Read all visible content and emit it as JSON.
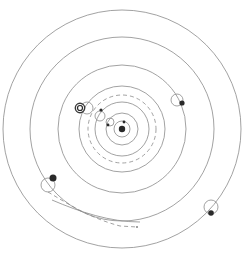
{
  "diagram": {
    "type": "geocentric planetary system",
    "center": {
      "x": 122,
      "y": 129
    },
    "colors": {
      "line": "#8a8a8a",
      "body": "#2a2a2a",
      "background": "#ffffff"
    },
    "orbits": [
      {
        "name": "moon",
        "r": 8,
        "style": "solid"
      },
      {
        "name": "mercury",
        "r": 16,
        "style": "solid"
      },
      {
        "name": "venus",
        "r": 27,
        "style": "solid"
      },
      {
        "name": "venus-path",
        "r": 34,
        "style": "dashed"
      },
      {
        "name": "sun",
        "r": 43,
        "style": "solid"
      },
      {
        "name": "mars",
        "r": 64,
        "style": "solid"
      },
      {
        "name": "jupiter",
        "r": 92,
        "style": "solid"
      },
      {
        "name": "saturn",
        "r": 119,
        "style": "solid"
      }
    ],
    "bodies": [
      {
        "name": "earth",
        "x": 122,
        "y": 129,
        "r": 3.2,
        "icon": "earth-icon"
      },
      {
        "name": "moon",
        "x": 124,
        "y": 122,
        "r": 1.4,
        "icon": "moon-icon"
      },
      {
        "name": "mercury",
        "x": 108,
        "y": 125,
        "r": 1.4,
        "epicycle": {
          "x": 110,
          "y": 122,
          "r": 4
        },
        "icon": "mercury-icon"
      },
      {
        "name": "venus",
        "x": 101,
        "y": 110,
        "r": 1.6,
        "epicycle": {
          "x": 100,
          "y": 116,
          "r": 5
        },
        "icon": "venus-icon"
      },
      {
        "name": "sun",
        "x": 80,
        "y": 108,
        "r": 3.5,
        "epicycle": {
          "x": 87,
          "y": 108,
          "r": 6
        },
        "icon": "sun-icon"
      },
      {
        "name": "mars",
        "x": 182,
        "y": 103,
        "r": 2.6,
        "epicycle": {
          "x": 177,
          "y": 100,
          "r": 6
        },
        "icon": "mars-icon"
      },
      {
        "name": "jupiter",
        "x": 53,
        "y": 178,
        "r": 3.5,
        "epicycle": {
          "x": 48,
          "y": 185,
          "r": 7
        },
        "icon": "jupiter-icon"
      },
      {
        "name": "saturn",
        "x": 211,
        "y": 213,
        "r": 2.8,
        "epicycle": {
          "x": 211,
          "y": 207,
          "r": 7
        },
        "icon": "saturn-icon"
      },
      {
        "name": "comet",
        "x": 137,
        "y": 227,
        "r": 0.8,
        "icon": "comet-icon"
      }
    ],
    "comet_trail": "M 48 192 C 70 205, 90 218, 120 226 L 137 227"
  }
}
